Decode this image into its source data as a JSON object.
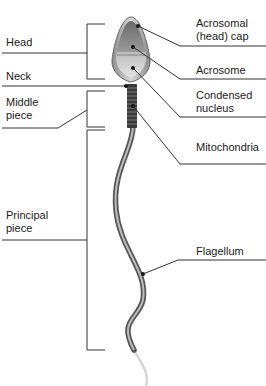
{
  "diagram": {
    "left_labels": [
      {
        "id": "head",
        "text": "Head"
      },
      {
        "id": "neck",
        "text": "Neck"
      },
      {
        "id": "middle_piece",
        "text": "Middle\npiece"
      },
      {
        "id": "principal_piece",
        "text": "Principal\npiece"
      }
    ],
    "right_labels": [
      {
        "id": "acrosomal_cap",
        "text": "Acrosomal\n(head) cap"
      },
      {
        "id": "acrosome",
        "text": "Acrosome"
      },
      {
        "id": "condensed_nucleus",
        "text": "Condensed\nnucleus"
      },
      {
        "id": "mitochondria",
        "text": "Mitochondria"
      },
      {
        "id": "flagellum",
        "text": "Flagellum"
      }
    ]
  }
}
